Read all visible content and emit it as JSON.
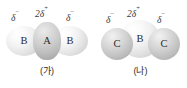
{
  "figure": {
    "type": "molecular-space-filling-diagram",
    "background_color": "#ffffff",
    "text_color": "#2b2b2b"
  },
  "molecules": [
    {
      "id": "ga",
      "caption": "(가)",
      "geometry": "linear",
      "atoms": [
        {
          "symbol": "B",
          "position": "left",
          "shade": "light"
        },
        {
          "symbol": "A",
          "position": "center",
          "shade": "mid"
        },
        {
          "symbol": "B",
          "position": "right",
          "shade": "light"
        }
      ],
      "charges": [
        {
          "position": "left",
          "coefficient": "",
          "symbol": "δ",
          "sign": "−"
        },
        {
          "position": "center",
          "coefficient": "2",
          "symbol": "δ",
          "sign": "+"
        },
        {
          "position": "right",
          "coefficient": "",
          "symbol": "δ",
          "sign": "−"
        }
      ]
    },
    {
      "id": "na",
      "caption": "(나)",
      "geometry": "bent",
      "atoms": [
        {
          "symbol": "C",
          "position": "left",
          "shade": "dark"
        },
        {
          "symbol": "B",
          "position": "center",
          "shade": "light"
        },
        {
          "symbol": "C",
          "position": "right",
          "shade": "dark"
        }
      ],
      "charges": [
        {
          "position": "left",
          "coefficient": "",
          "symbol": "δ",
          "sign": "−"
        },
        {
          "position": "center",
          "coefficient": "2",
          "symbol": "δ",
          "sign": "+"
        },
        {
          "position": "right",
          "coefficient": "",
          "symbol": "δ",
          "sign": "−"
        }
      ]
    }
  ]
}
